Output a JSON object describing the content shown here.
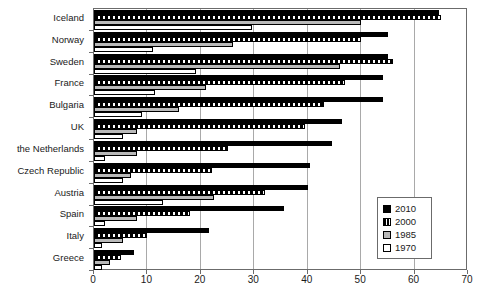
{
  "chart_data": {
    "type": "bar",
    "orientation": "horizontal",
    "title": "",
    "xlabel": "",
    "ylabel": "",
    "xlim": [
      0,
      70
    ],
    "xticks": [
      0,
      10,
      20,
      30,
      40,
      50,
      60,
      70
    ],
    "grid": true,
    "grid_axis": "x",
    "legend_position": "right",
    "categories": [
      "Iceland",
      "Norway",
      "Sweden",
      "France",
      "Bulgaria",
      "UK",
      "the Netherlands",
      "Czech Republic",
      "Austria",
      "Spain",
      "Italy",
      "Greece"
    ],
    "series": [
      {
        "name": "2010",
        "color": "#000000",
        "pattern": "solid",
        "values": [
          64.5,
          55,
          55,
          54,
          54,
          46.5,
          44.5,
          40.5,
          40,
          35.5,
          21.5,
          7.5
        ]
      },
      {
        "name": "2000",
        "color": "#000000",
        "pattern": "hatched",
        "values": [
          65,
          50,
          56,
          47,
          43,
          39.5,
          25,
          22,
          32,
          18,
          10,
          5
        ]
      },
      {
        "name": "1985",
        "color": "#b9b9b9",
        "pattern": "gray",
        "values": [
          50,
          26,
          46,
          21,
          16,
          8,
          8,
          7,
          22.5,
          8,
          5.5,
          3
        ]
      },
      {
        "name": "1970",
        "color": "#ffffff",
        "pattern": "open",
        "values": [
          29.5,
          11,
          19,
          11.5,
          9,
          5.5,
          2,
          5.5,
          13,
          2,
          1.5,
          1.5
        ]
      }
    ]
  },
  "legend": {
    "entries": [
      {
        "label": "2010",
        "swatch": "y2010"
      },
      {
        "label": "2000",
        "swatch": "y2000"
      },
      {
        "label": "1985",
        "swatch": "y1985"
      },
      {
        "label": "1970",
        "swatch": "y1970"
      }
    ]
  }
}
